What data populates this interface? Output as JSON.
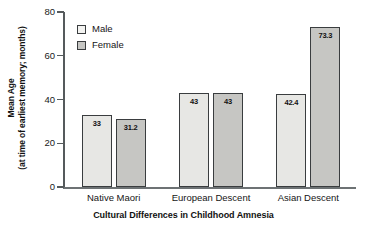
{
  "chart_data": {
    "type": "bar",
    "title": "",
    "xlabel": "Cultural Differences in Childhood Amnesia",
    "ylabel_line1": "Mean Age",
    "ylabel_line2": "(at time of earliest memory; months)",
    "categories": [
      "Native Maori",
      "European Descent",
      "Asian Descent"
    ],
    "series": [
      {
        "name": "Male",
        "values": [
          33,
          43,
          42.4
        ],
        "labels": [
          "33",
          "43",
          "42.4"
        ],
        "color": "#e7e7e4"
      },
      {
        "name": "Female",
        "values": [
          31.2,
          43,
          73.3
        ],
        "labels": [
          "31.2",
          "43",
          "73.3"
        ],
        "color": "#c6c6c3"
      }
    ],
    "ylim": [
      0,
      80
    ],
    "yticks": [
      0,
      20,
      40,
      60,
      80
    ],
    "ytick_labels": [
      "0",
      "20",
      "40",
      "60",
      "80"
    ],
    "grid": false,
    "legend_position": "upper-left-inside",
    "axis_color": "#555a5c",
    "bar_outline_color": "#3a3d3f"
  },
  "legend": {
    "items": [
      {
        "label": "Male"
      },
      {
        "label": "Female"
      }
    ]
  }
}
